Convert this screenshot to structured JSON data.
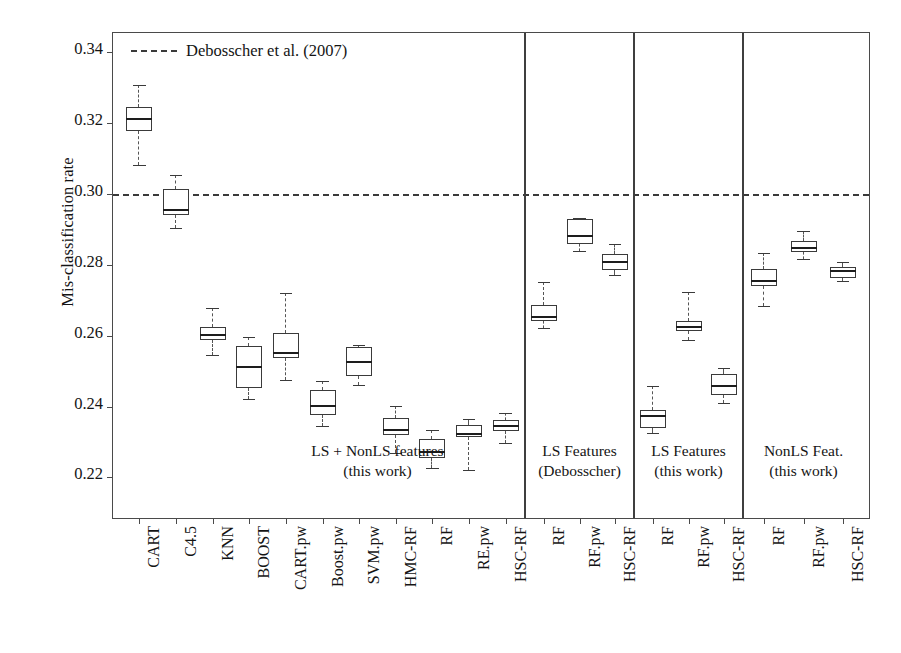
{
  "chart_data": {
    "type": "box",
    "title": "",
    "xlabel": "",
    "ylabel": "Mis-classification rate",
    "ylim": [
      0.208,
      0.3455
    ],
    "yticks": [
      0.22,
      0.24,
      0.26,
      0.28,
      0.3,
      0.32,
      0.34
    ],
    "ytick_labels": [
      "0.22",
      "0.24",
      "0.26",
      "0.28",
      "0.30",
      "0.32",
      "0.34"
    ],
    "grid": false,
    "legend": {
      "position": "top-left-inside",
      "entries": [
        {
          "label": "Debosscher et al. (2007)",
          "style": "dashed-line",
          "color": "#3a3a3a",
          "value": 0.3
        }
      ]
    },
    "reference_line": {
      "label": "Debosscher et al. (2007)",
      "value": 0.3,
      "style": "dashed"
    },
    "groups": [
      {
        "name": "LS + NonLS features",
        "note_line1": "LS + NonLS features",
        "note_line2": "(this work)",
        "boxes": [
          {
            "label": "CART",
            "whisker_low": 0.3082,
            "q1": 0.3178,
            "median": 0.3215,
            "q3": 0.3245,
            "whisker_high": 0.3309
          },
          {
            "label": "C4.5",
            "whisker_low": 0.2905,
            "q1": 0.2942,
            "median": 0.2957,
            "q3": 0.3014,
            "whisker_high": 0.3054
          },
          {
            "label": "KNN",
            "whisker_low": 0.2546,
            "q1": 0.2589,
            "median": 0.2606,
            "q3": 0.2625,
            "whisker_high": 0.2678
          },
          {
            "label": "BOOST",
            "whisker_low": 0.2421,
            "q1": 0.2454,
            "median": 0.2515,
            "q3": 0.257,
            "whisker_high": 0.2598
          },
          {
            "label": "CART.pw",
            "whisker_low": 0.2476,
            "q1": 0.2538,
            "median": 0.2554,
            "q3": 0.2609,
            "whisker_high": 0.2722
          },
          {
            "label": "Boost.pw",
            "whisker_low": 0.2344,
            "q1": 0.2377,
            "median": 0.2405,
            "q3": 0.2447,
            "whisker_high": 0.2473
          },
          {
            "label": "SVM.pw",
            "whisker_low": 0.246,
            "q1": 0.2487,
            "median": 0.2529,
            "q3": 0.2568,
            "whisker_high": 0.2573
          },
          {
            "label": "HMC-RF",
            "whisker_low": 0.2268,
            "q1": 0.2321,
            "median": 0.2338,
            "q3": 0.2368,
            "whisker_high": 0.2401
          },
          {
            "label": "RF",
            "whisker_low": 0.2227,
            "q1": 0.2255,
            "median": 0.2274,
            "q3": 0.2308,
            "whisker_high": 0.2335
          },
          {
            "label": "RE.pw",
            "whisker_low": 0.2221,
            "q1": 0.2313,
            "median": 0.2327,
            "q3": 0.2349,
            "whisker_high": 0.2365
          },
          {
            "label": "HSC-RF",
            "whisker_low": 0.2296,
            "q1": 0.233,
            "median": 0.2348,
            "q3": 0.2363,
            "whisker_high": 0.2382
          }
        ]
      },
      {
        "name": "LS Features (Debosscher)",
        "note_line1": "LS Features",
        "note_line2": "(Debosscher)",
        "boxes": [
          {
            "label": "RF",
            "whisker_low": 0.2622,
            "q1": 0.2641,
            "median": 0.2656,
            "q3": 0.2686,
            "whisker_high": 0.2752
          },
          {
            "label": "RF.pw",
            "whisker_low": 0.2839,
            "q1": 0.286,
            "median": 0.2885,
            "q3": 0.2929,
            "whisker_high": 0.2934
          },
          {
            "label": "HSC-RF",
            "whisker_low": 0.2773,
            "q1": 0.2787,
            "median": 0.281,
            "q3": 0.2831,
            "whisker_high": 0.286
          }
        ]
      },
      {
        "name": "LS Features (this work)",
        "note_line1": "LS Features",
        "note_line2": "(this work)",
        "boxes": [
          {
            "label": "RF",
            "whisker_low": 0.2325,
            "q1": 0.2339,
            "median": 0.2376,
            "q3": 0.2391,
            "whisker_high": 0.2459
          },
          {
            "label": "RF.pw",
            "whisker_low": 0.2588,
            "q1": 0.2614,
            "median": 0.2627,
            "q3": 0.2641,
            "whisker_high": 0.2723
          },
          {
            "label": "HSC-RF",
            "whisker_low": 0.241,
            "q1": 0.2434,
            "median": 0.2462,
            "q3": 0.2491,
            "whisker_high": 0.2509
          }
        ]
      },
      {
        "name": "NonLS Feat. (this work)",
        "note_line1": "NonLS Feat.",
        "note_line2": "(this work)",
        "boxes": [
          {
            "label": "RF",
            "whisker_low": 0.2684,
            "q1": 0.2741,
            "median": 0.2758,
            "q3": 0.2789,
            "whisker_high": 0.2835
          },
          {
            "label": "RF.pw",
            "whisker_low": 0.2818,
            "q1": 0.2836,
            "median": 0.2852,
            "q3": 0.2869,
            "whisker_high": 0.2897
          },
          {
            "label": "HSC-RF",
            "whisker_low": 0.2754,
            "q1": 0.2764,
            "median": 0.2785,
            "q3": 0.2794,
            "whisker_high": 0.2809
          }
        ]
      }
    ],
    "colors": {
      "line": "#3a3a3a",
      "median": "#1d1d1d",
      "reference": "#3a3a3a",
      "background": "#ffffff"
    }
  }
}
